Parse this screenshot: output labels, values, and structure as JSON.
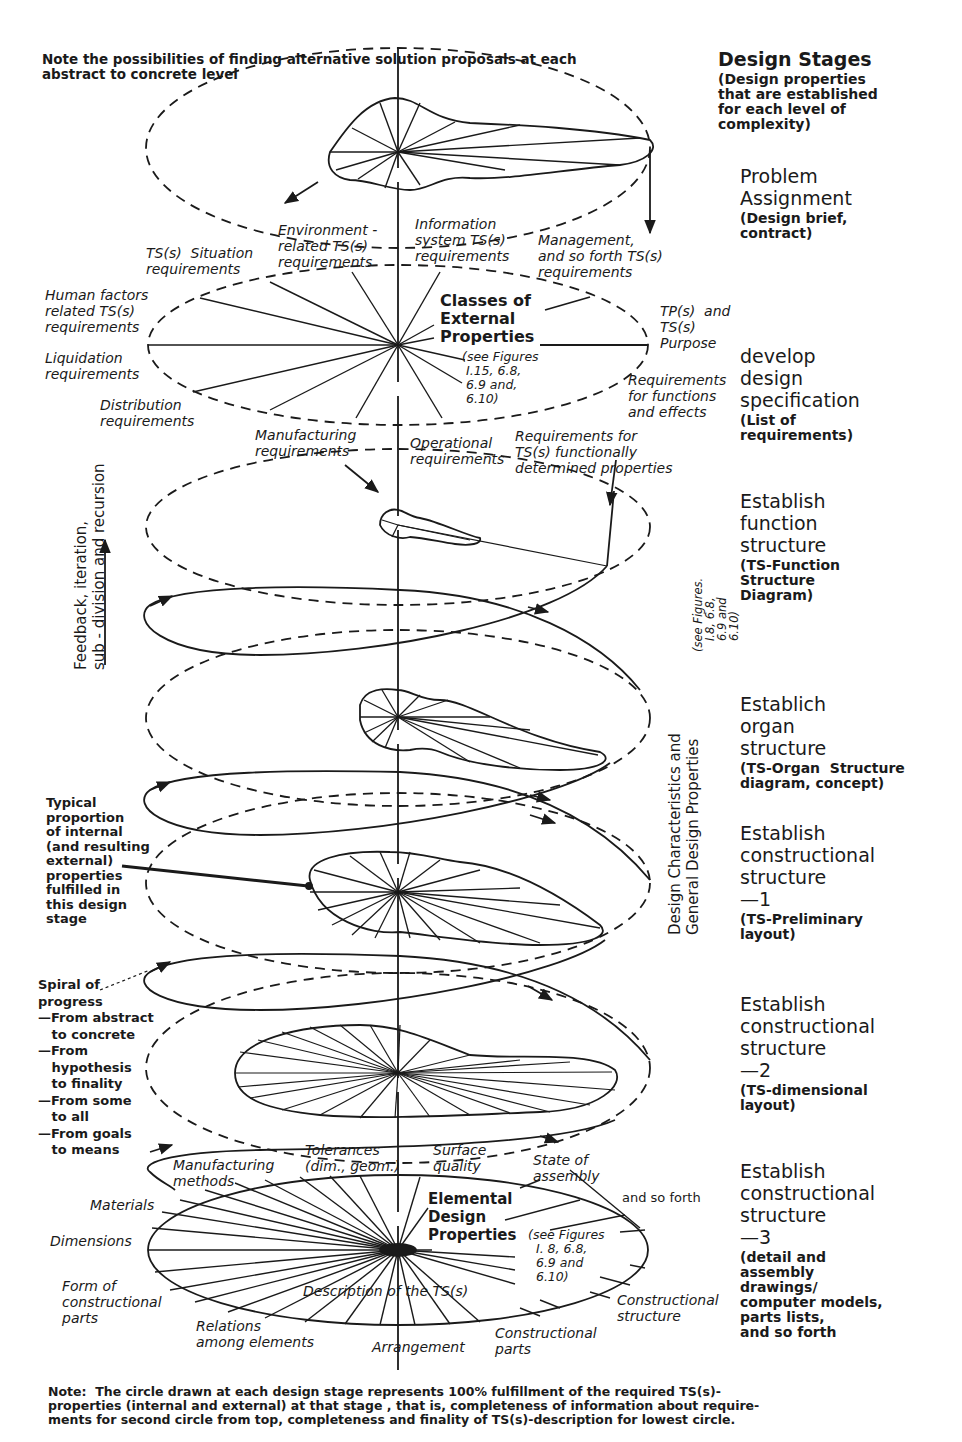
{
  "notes": {
    "top": "Note the possibilities of finding alternative solution proposals at each\nabstract to concrete level",
    "bottom": "Note:  The circle drawn at each design stage represents 100% fulfillment of the required TS(s)-\nproperties (internal and external) at that stage , that is, completeness of information about require-\nments for second circle from top, completeness and finality of TS(s)-description for lowest circle."
  },
  "stages_header": {
    "title": "Design Stages",
    "subtitle": "(Design properties\nthat are established\nfor each level of\ncomplexity)"
  },
  "stages": [
    {
      "title": "Problem\nAssignment",
      "subtitle": "(Design brief,\ncontract)"
    },
    {
      "title": "develop\ndesign\nspecification",
      "subtitle": "(List of\nrequirements)"
    },
    {
      "title": "Establish\nfunction\nstructure",
      "subtitle": "(TS-Function\nStructure\nDiagram)"
    },
    {
      "title": "Establich\norgan\nstructure",
      "subtitle": "(TS-Organ  Structure\ndiagram, concept)"
    },
    {
      "title": "Establish\nconstructional\nstructure\n—1",
      "subtitle": "(TS-Preliminary\nlayout)"
    },
    {
      "title": "Establish\nconstructional\nstructure\n—2",
      "subtitle": "(TS-dimensional\nlayout)"
    },
    {
      "title": "Establish\nconstructional\nstructure\n—3",
      "subtitle": "(detail and\nassembly\ndrawings/\ncomputer models,\nparts lists,\nand so forth"
    }
  ],
  "external_properties": {
    "center_title": "Classes of\nExternal\nProperties",
    "center_ref": "(see Figures\n I.15, 6.8,\n 6.9 and,\n 6.10)",
    "labels": [
      "TS(s)  Situation\nrequirements",
      "Environment -\nrelated TS(s)\nrequirements",
      "Information\nsystem TS(s)\nrequirements",
      "Management,\nand so forth TS(s)\nrequirements",
      "Human factors\nrelated TS(s)\nrequirements",
      "TP(s)  and\nTS(s)\nPurpose",
      "Liquidation\nrequirements",
      "Requirements\nfor functions\nand effects",
      "Distribution\nrequirements",
      "Manufacturing\nrequirements",
      "Operational\nrequirements",
      "Requirements for\nTS(s) functionally\ndetermined properties"
    ]
  },
  "side_annotations": {
    "feedback": "Feedback, iteration,\nsub - division and recursion",
    "design_characteristics": "Design Characteristics and\nGeneral Design Properties",
    "see_figures": "(see Figures.\n   I.8, 6.8,\n   6.9 and\n   6.10)",
    "typical_proportion": "Typical\nproportion\nof internal\n(and resulting\nexternal)\nproperties\nfulfilled in\nthis design\nstage",
    "spiral": "Spiral of\nprogress\n—From abstract\n   to concrete\n—From\n   hypothesis\n   to finality\n—From some\n   to all\n—From goals\n   to means"
  },
  "elemental_properties": {
    "center_title": "Elemental\nDesign\nProperties",
    "center_ref": "(see Figures\n  I. 8, 6.8,\n  6.9 and\n  6.10)",
    "description": "Description of the TS(s)",
    "labels": [
      "Manufacturing\nmethods",
      "Tolerances\n(dim., geom.)",
      "Surface\nquality",
      "State of\nassembly",
      "and so forth",
      "Materials",
      "Dimensions",
      "Form of\nconstructional\nparts",
      "Relations\namong elements",
      "Arrangement",
      "Constructional\nparts",
      "Constructional\nstructure"
    ]
  },
  "colors": {
    "ink": "#1a1a1a",
    "background": "#ffffff"
  }
}
